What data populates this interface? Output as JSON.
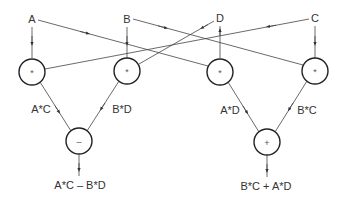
{
  "diagram": {
    "type": "dataflow-graph",
    "inputs": [
      {
        "id": "A",
        "label": "A"
      },
      {
        "id": "B",
        "label": "B"
      },
      {
        "id": "D",
        "label": "D"
      },
      {
        "id": "C",
        "label": "C"
      }
    ],
    "multipliers": [
      {
        "id": "m1",
        "symbol": "*",
        "output_label": "A*C",
        "operands": [
          "A",
          "C"
        ]
      },
      {
        "id": "m2",
        "symbol": "*",
        "output_label": "B*D",
        "operands": [
          "B",
          "D"
        ]
      },
      {
        "id": "m3",
        "symbol": "*",
        "output_label": "A*D",
        "operands": [
          "A",
          "D"
        ]
      },
      {
        "id": "m4",
        "symbol": "*",
        "output_label": "B*C",
        "operands": [
          "B",
          "C"
        ]
      }
    ],
    "combiners": [
      {
        "id": "sub",
        "symbol": "–",
        "inputs": [
          "m1",
          "m2"
        ],
        "output_label": "A*C – B*D"
      },
      {
        "id": "add",
        "symbol": "+",
        "inputs": [
          "m3",
          "m4"
        ],
        "output_label": "B*C + A*D"
      }
    ],
    "edges": [
      {
        "from": "A",
        "to": "m1"
      },
      {
        "from": "A",
        "to": "m3"
      },
      {
        "from": "B",
        "to": "m2"
      },
      {
        "from": "B",
        "to": "m4"
      },
      {
        "from": "C",
        "to": "m4"
      },
      {
        "from": "C",
        "to": "m1"
      },
      {
        "from": "D",
        "to": "m2"
      },
      {
        "from": "m3",
        "to": "D"
      },
      {
        "from": "m1",
        "to": "sub"
      },
      {
        "from": "m2",
        "to": "sub"
      },
      {
        "from": "m3",
        "to": "add"
      },
      {
        "from": "m4",
        "to": "add"
      },
      {
        "from": "sub",
        "to": "out1"
      },
      {
        "from": "add",
        "to": "out2"
      }
    ]
  }
}
